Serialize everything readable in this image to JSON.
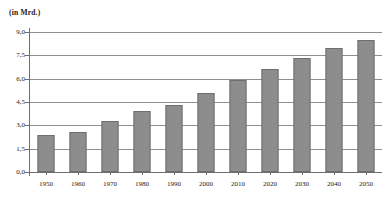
{
  "chart_data": {
    "type": "bar",
    "title": "",
    "subtitle": "",
    "unit_label": "(in Mrd.)",
    "xlabel": "",
    "ylabel": "",
    "categories": [
      "1950",
      "1960",
      "1970",
      "1980",
      "1990",
      "2000",
      "2010",
      "2020",
      "2030",
      "2040",
      "2050"
    ],
    "values": [
      2.4,
      2.6,
      3.3,
      3.9,
      4.3,
      5.1,
      5.9,
      6.6,
      7.3,
      8.0,
      8.5
    ],
    "series": [
      {
        "name": "Weltbevölkerung",
        "values": [
          2.4,
          2.6,
          3.3,
          3.9,
          4.3,
          5.1,
          5.9,
          6.6,
          7.3,
          8.0,
          8.5
        ]
      }
    ],
    "ylim": [
      0.0,
      9.0
    ],
    "ytick_values": [
      0.0,
      1.5,
      3.0,
      4.5,
      6.0,
      7.5,
      9.0
    ],
    "ytick_labels": [
      "0,0",
      "1,5",
      "3,0",
      "4,5",
      "6,0",
      "7,5",
      "9,0"
    ],
    "grid": true,
    "grid_axis": "y",
    "legend": false,
    "legend_position": "none",
    "bar_color": "#8d8d8d",
    "bar_border_color": "#6f6f6f",
    "axis_color": "#6e6e6e",
    "grid_color": "#8f8f8f",
    "background_color": "#ffffff",
    "text_color": "#1c1c1c",
    "annotations": []
  }
}
